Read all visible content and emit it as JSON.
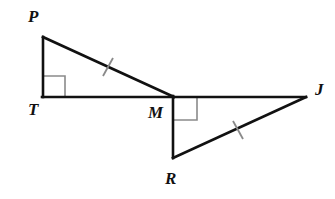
{
  "figure": {
    "type": "geometry-diagram",
    "background_color": "#ffffff",
    "stroke_color": "#111111",
    "mark_color": "#8a8a8a",
    "stroke_width": 2.6,
    "mark_stroke_width": 1.6,
    "canvas": {
      "width": 335,
      "height": 199
    },
    "points": {
      "P": {
        "x": 43,
        "y": 37,
        "label": "P",
        "label_x": 28,
        "label_y": 8
      },
      "T": {
        "x": 43,
        "y": 97,
        "label": "T",
        "label_x": 28,
        "label_y": 101
      },
      "M": {
        "x": 173,
        "y": 97,
        "label": "M",
        "label_x": 148,
        "label_y": 104
      },
      "R": {
        "x": 173,
        "y": 157,
        "label": "R",
        "label_x": 165,
        "label_y": 170
      },
      "J": {
        "x": 306,
        "y": 97,
        "label": "J",
        "label_x": 315,
        "label_y": 81
      }
    },
    "segments": [
      {
        "name": "segment-PT",
        "from": "P",
        "to": "T"
      },
      {
        "name": "segment-PM",
        "from": "P",
        "to": "M"
      },
      {
        "name": "segment-TJ",
        "from": "T",
        "to": "J"
      },
      {
        "name": "segment-MR",
        "from": "M",
        "to": "R"
      },
      {
        "name": "segment-RJ",
        "from": "R",
        "to": "J"
      }
    ],
    "right_angles": [
      {
        "name": "right-angle-T",
        "at": "T",
        "size": 21,
        "dx": 1,
        "dy": -1
      },
      {
        "name": "right-angle-M",
        "at": "M",
        "size": 23,
        "dx": 1,
        "dy": 1
      }
    ],
    "congruence_ticks": [
      {
        "name": "tick-PM",
        "on": "segment-PM",
        "x": 108,
        "y": 67,
        "count": 1
      },
      {
        "name": "tick-RJ",
        "on": "segment-RJ",
        "x": 238,
        "y": 130,
        "count": 1
      }
    ],
    "labels": {
      "P": "P",
      "T": "T",
      "M": "M",
      "R": "R",
      "J": "J"
    }
  }
}
